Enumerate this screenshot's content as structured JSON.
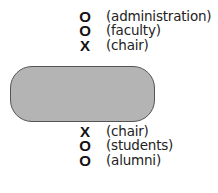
{
  "top_group": [
    {
      "symbol": "O",
      "label": "(administration)"
    },
    {
      "symbol": "O",
      "label": "(faculty)"
    },
    {
      "symbol": "X",
      "label": "(chair)"
    }
  ],
  "box": {
    "fill": "#b4b4b4",
    "stroke": "#555555"
  },
  "bottom_group": [
    {
      "symbol": "X",
      "label": "(chair)"
    },
    {
      "symbol": "O",
      "label": "(students)"
    },
    {
      "symbol": "O",
      "label": "(alumni)"
    }
  ]
}
